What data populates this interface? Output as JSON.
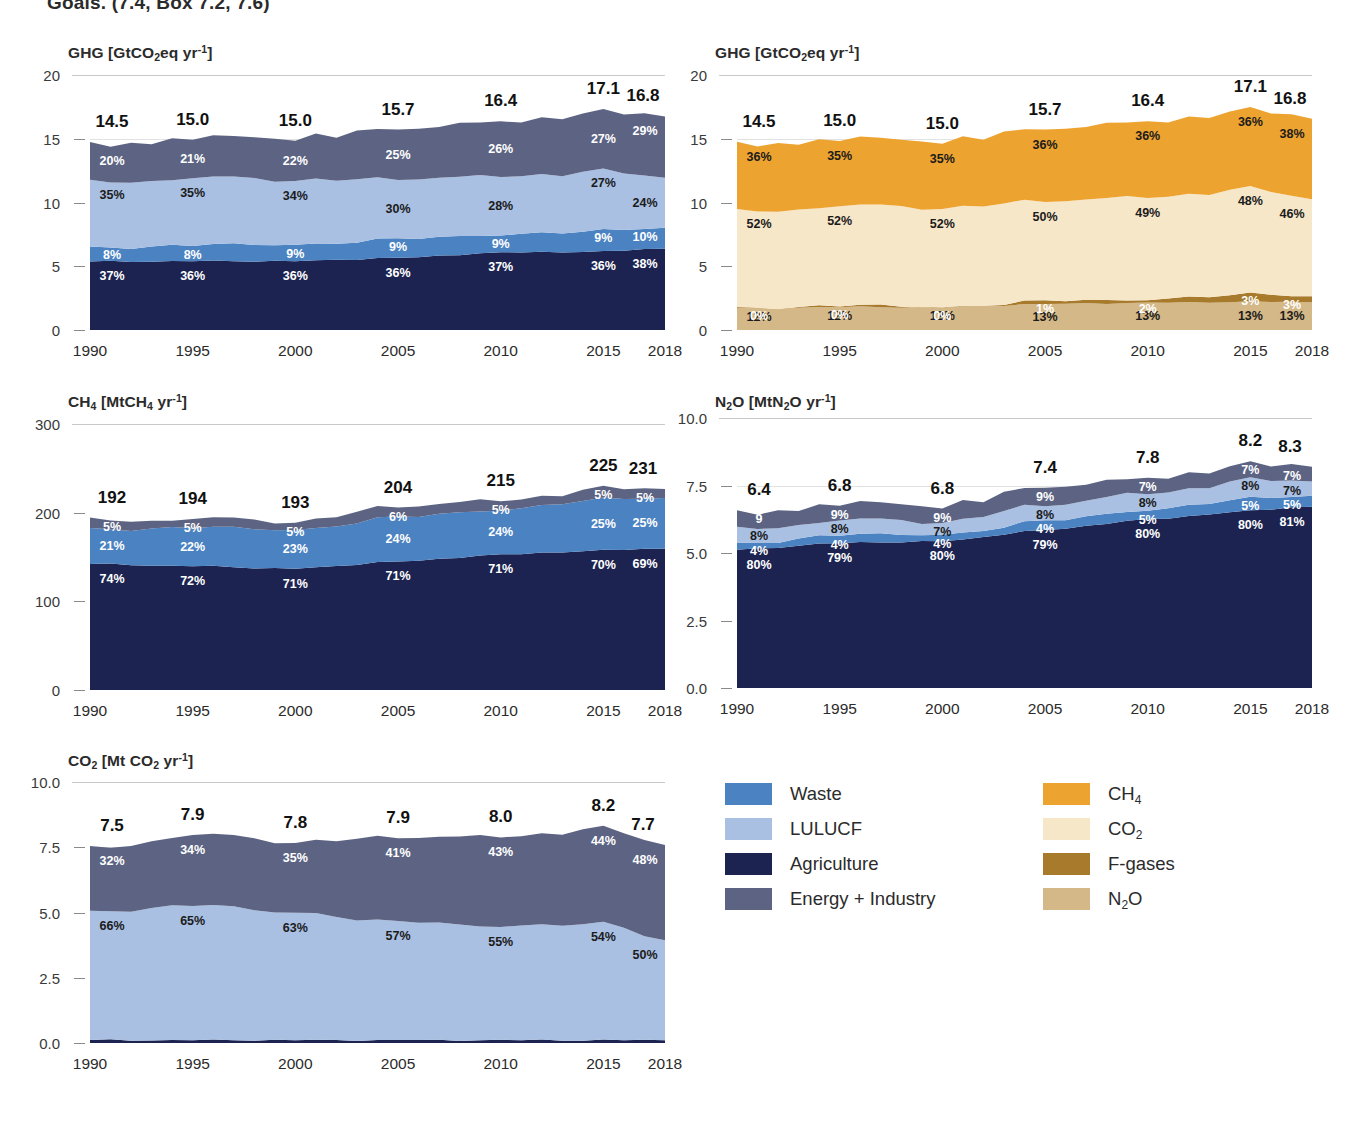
{
  "clipped_caption": "Goals. (7.4, Box 7.2, 7.6)",
  "xaxis": {
    "ticks": [
      "1990",
      "1995",
      "2000",
      "2005",
      "2010",
      "2015",
      "2018"
    ],
    "min": 1990,
    "max": 2018
  },
  "legend": {
    "left_column": [
      {
        "label": "Waste",
        "color": "#4a82c2",
        "key": "waste"
      },
      {
        "label": "LULUCF",
        "color": "#a9c0e2",
        "key": "lulucf"
      },
      {
        "label": "Agriculture",
        "color": "#1c2350",
        "key": "agriculture"
      },
      {
        "label": "Energy + Industry",
        "color": "#5d6483",
        "key": "energy-industry"
      }
    ],
    "right_column": [
      {
        "label": "CH₄",
        "color": "#eda32f",
        "key": "ch4"
      },
      {
        "label": "CO₂",
        "color": "#f7e7c9",
        "key": "co2"
      },
      {
        "label": "F-gases",
        "color": "#a87a2c",
        "key": "f-gases"
      },
      {
        "label": "N₂O",
        "color": "#d4b887",
        "key": "n2o"
      }
    ]
  },
  "chart_data": [
    {
      "id": "ghg-by-sector",
      "type": "area",
      "title": "GHG [GtCO₂eq yr⁻¹]",
      "ylabel": "GHG [GtCO2eq yr-1]",
      "xlabel": "",
      "ylim": [
        0,
        20
      ],
      "yticks": [
        0,
        5,
        10,
        15,
        20
      ],
      "ytick_labels": [
        "0",
        "5",
        "10",
        "15",
        "20"
      ],
      "grid": true,
      "x": [
        1990,
        1995,
        2000,
        2005,
        2010,
        2015,
        2018
      ],
      "totals": [
        14.5,
        15.0,
        15.0,
        15.7,
        16.4,
        17.1,
        16.8
      ],
      "total_labels": [
        "14.5",
        "15.0",
        "15.0",
        "15.7",
        "16.4",
        "17.1",
        "16.8"
      ],
      "series": [
        {
          "name": "Agriculture",
          "color": "#1c2350",
          "percent_labels": [
            "37%",
            "36%",
            "36%",
            "36%",
            "37%",
            "36%",
            "38%"
          ],
          "values": [
            5.37,
            5.4,
            5.4,
            5.65,
            6.07,
            6.16,
            6.38
          ]
        },
        {
          "name": "Waste",
          "color": "#4a82c2",
          "percent_labels": [
            "8%",
            "8%",
            "9%",
            "9%",
            "9%",
            "9%",
            "10%"
          ],
          "values": [
            1.16,
            1.2,
            1.35,
            1.41,
            1.48,
            1.54,
            1.68
          ]
        },
        {
          "name": "LULUCF",
          "color": "#a9c0e2",
          "percent_labels": [
            "35%",
            "35%",
            "34%",
            "30%",
            "28%",
            "27%",
            "24%"
          ],
          "values": [
            5.08,
            5.25,
            5.1,
            4.71,
            4.59,
            4.62,
            4.03
          ]
        },
        {
          "name": "Energy + Industry",
          "color": "#5d6483",
          "percent_labels": [
            "20%",
            "21%",
            "22%",
            "25%",
            "26%",
            "27%",
            "29%"
          ],
          "values": [
            2.9,
            3.15,
            3.3,
            3.93,
            4.26,
            4.62,
            4.87
          ]
        }
      ]
    },
    {
      "id": "ghg-by-gas",
      "type": "area",
      "title": "GHG [GtCO₂eq yr⁻¹]",
      "ylabel": "GHG [GtCO2eq yr-1]",
      "xlabel": "",
      "ylim": [
        0,
        20
      ],
      "yticks": [
        0,
        5,
        10,
        15,
        20
      ],
      "ytick_labels": [
        "0",
        "5",
        "10",
        "15",
        "20"
      ],
      "grid": true,
      "x": [
        1990,
        1995,
        2000,
        2005,
        2010,
        2015,
        2018
      ],
      "totals": [
        14.5,
        15.0,
        15.0,
        15.7,
        16.4,
        17.1,
        16.8
      ],
      "total_labels": [
        "14.5",
        "15.0",
        "15.0",
        "15.7",
        "16.4",
        "17.1",
        "16.8"
      ],
      "series": [
        {
          "name": "N₂O",
          "color": "#d4b887",
          "percent_labels": [
            "12%",
            "12%",
            "12%",
            "13%",
            "13%",
            "13%",
            "13%"
          ],
          "values": [
            1.74,
            1.8,
            1.8,
            2.04,
            2.13,
            2.22,
            2.18
          ]
        },
        {
          "name": "F-gases",
          "color": "#a87a2c",
          "percent_labels": [
            "0%",
            "0%",
            "0%",
            "1%",
            "2%",
            "3%",
            "3%"
          ],
          "values": [
            0.04,
            0.05,
            0.06,
            0.16,
            0.33,
            0.51,
            0.5
          ]
        },
        {
          "name": "CO₂",
          "color": "#f7e7c9",
          "percent_labels": [
            "52%",
            "52%",
            "52%",
            "50%",
            "49%",
            "48%",
            "46%"
          ],
          "values": [
            7.54,
            7.8,
            7.8,
            7.85,
            8.04,
            8.21,
            7.73
          ]
        },
        {
          "name": "CH₄",
          "color": "#eda32f",
          "percent_labels": [
            "36%",
            "35%",
            "35%",
            "36%",
            "36%",
            "36%",
            "38%"
          ],
          "values": [
            5.22,
            5.25,
            5.25,
            5.65,
            5.9,
            6.16,
            6.38
          ]
        }
      ]
    },
    {
      "id": "ch4-by-sector",
      "type": "area",
      "title": "CH₄ [MtCH₄ yr⁻¹]",
      "ylabel": "CH4 [MtCH4 yr-1]",
      "xlabel": "",
      "ylim": [
        0,
        300
      ],
      "yticks": [
        0,
        100,
        200,
        300
      ],
      "ytick_labels": [
        "0",
        "100",
        "200",
        "300"
      ],
      "grid": true,
      "x": [
        1990,
        1995,
        2000,
        2005,
        2010,
        2015,
        2018
      ],
      "totals": [
        192,
        194,
        193,
        204,
        215,
        225,
        231
      ],
      "total_labels": [
        "192",
        "194",
        "193",
        "204",
        "215",
        "225",
        "231"
      ],
      "series": [
        {
          "name": "Agriculture",
          "color": "#1c2350",
          "percent_labels": [
            "74%",
            "72%",
            "71%",
            "71%",
            "71%",
            "70%",
            "69%"
          ],
          "values": [
            142.1,
            139.7,
            137.0,
            144.8,
            152.7,
            157.5,
            159.4
          ]
        },
        {
          "name": "Waste",
          "color": "#4a82c2",
          "percent_labels": [
            "21%",
            "22%",
            "23%",
            "24%",
            "24%",
            "25%",
            "25%"
          ],
          "values": [
            40.3,
            42.7,
            44.4,
            49.0,
            51.6,
            56.3,
            57.8
          ]
        },
        {
          "name": "Energy + Industry",
          "color": "#5d6483",
          "percent_labels": [
            "5%",
            "5%",
            "5%",
            "6%",
            "5%",
            "5%",
            "5%"
          ],
          "values": [
            9.6,
            9.7,
            9.7,
            12.2,
            10.8,
            11.3,
            11.6
          ]
        }
      ]
    },
    {
      "id": "n2o-by-sector",
      "type": "area",
      "title": "N₂O [MtN₂O yr⁻¹]",
      "ylabel": "N2O [MtN2O yr-1]",
      "xlabel": "",
      "ylim": [
        0,
        10.0
      ],
      "yticks": [
        0.0,
        2.5,
        5.0,
        7.5,
        10.0
      ],
      "ytick_labels": [
        "0.0",
        "2.5",
        "5.0",
        "7.5",
        "10.0"
      ],
      "grid": true,
      "x": [
        1990,
        1995,
        2000,
        2005,
        2010,
        2015,
        2018
      ],
      "totals": [
        6.4,
        6.8,
        6.8,
        7.4,
        7.8,
        8.2,
        8.3
      ],
      "total_labels": [
        "6.4",
        "6.8",
        "6.8",
        "7.4",
        "7.8",
        "8.2",
        "8.3"
      ],
      "series": [
        {
          "name": "Agriculture",
          "color": "#1c2350",
          "percent_labels": [
            "80%",
            "79%",
            "80%",
            "79%",
            "80%",
            "80%",
            "81%"
          ],
          "values": [
            5.12,
            5.37,
            5.44,
            5.85,
            6.24,
            6.56,
            6.72
          ]
        },
        {
          "name": "Waste",
          "color": "#4a82c2",
          "percent_labels": [
            "4%",
            "4%",
            "4%",
            "4%",
            "5%",
            "5%",
            "5%"
          ],
          "values": [
            0.26,
            0.27,
            0.27,
            0.3,
            0.39,
            0.41,
            0.42
          ]
        },
        {
          "name": "LULUCF",
          "color": "#a9c0e2",
          "percent_labels": [
            "8%",
            "8%",
            "7%",
            "8%",
            "8%",
            "8%",
            "7%"
          ],
          "values": [
            0.51,
            0.54,
            0.48,
            0.59,
            0.62,
            0.66,
            0.58
          ]
        },
        {
          "name": "Energy + Industry",
          "color": "#5d6483",
          "percent_labels": [
            "9",
            "9%",
            "9%",
            "9%",
            "7%",
            "7%",
            "7%"
          ],
          "values": [
            0.58,
            0.61,
            0.61,
            0.67,
            0.55,
            0.57,
            0.58
          ]
        }
      ]
    },
    {
      "id": "co2-by-sector",
      "type": "area",
      "title": "CO₂ [Mt CO₂ yr⁻¹]",
      "ylabel": "CO2 [Mt CO2 yr-1]",
      "xlabel": "",
      "ylim": [
        0,
        10.0
      ],
      "yticks": [
        0.0,
        2.5,
        5.0,
        7.5,
        10.0
      ],
      "ytick_labels": [
        "0.0",
        "2.5",
        "5.0",
        "7.5",
        "10.0"
      ],
      "grid": true,
      "x": [
        1990,
        1995,
        2000,
        2005,
        2010,
        2015,
        2018
      ],
      "totals": [
        7.5,
        7.9,
        7.8,
        7.9,
        8.0,
        8.2,
        7.7
      ],
      "total_labels": [
        "7.5",
        "7.9",
        "7.8",
        "7.9",
        "8.0",
        "8.2",
        "7.7"
      ],
      "series": [
        {
          "name": "Agriculture",
          "color": "#1c2350",
          "percent_labels": [
            "",
            "",
            "",
            "",
            "",
            "",
            ""
          ],
          "values": [
            0.11,
            0.11,
            0.11,
            0.11,
            0.11,
            0.11,
            0.11
          ]
        },
        {
          "name": "LULUCF",
          "color": "#a9c0e2",
          "percent_labels": [
            "66%",
            "65%",
            "63%",
            "57%",
            "55%",
            "54%",
            "50%"
          ],
          "values": [
            4.95,
            5.14,
            4.91,
            4.5,
            4.4,
            4.43,
            3.85
          ]
        },
        {
          "name": "Energy + Industry",
          "color": "#5d6483",
          "percent_labels": [
            "32%",
            "34%",
            "35%",
            "41%",
            "43%",
            "44%",
            "48%"
          ],
          "values": [
            2.4,
            2.69,
            2.73,
            3.24,
            3.44,
            3.61,
            3.7
          ]
        }
      ]
    }
  ]
}
